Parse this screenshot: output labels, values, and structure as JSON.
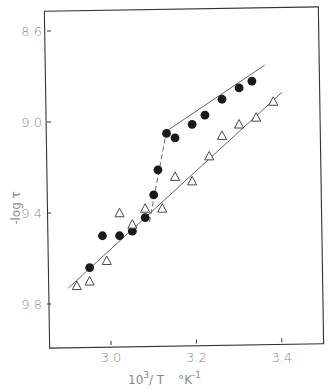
{
  "chart_data": {
    "type": "scatter",
    "title": "",
    "xlabel": "10^3/T  °K^-1",
    "xlabel_parts": {
      "base": "10",
      "sup": "3",
      "rest": "/ T",
      "unit": "°K",
      "unit_sup": "-1"
    },
    "ylabel": "-log τ",
    "xlim": [
      2.85,
      3.5
    ],
    "ylim": [
      10.0,
      8.5
    ],
    "y_inverted": true,
    "grid": false,
    "legend": null,
    "x_ticks": [
      3.0,
      3.2,
      3.4
    ],
    "x_tick_labels": [
      "3.0",
      "3.2",
      "3.4"
    ],
    "y_ticks": [
      8.6,
      9.0,
      9.4,
      9.8
    ],
    "y_tick_labels": [
      "8.6",
      "9.0",
      "9.4",
      "9.8"
    ],
    "series": [
      {
        "name": "filled circles",
        "marker": "filled-circle",
        "color": "#1a1a1a",
        "x": [
          2.95,
          2.98,
          3.02,
          3.05,
          3.08,
          3.1,
          3.11,
          3.13,
          3.15,
          3.19,
          3.22,
          3.26,
          3.3,
          3.33
        ],
        "y": [
          9.64,
          9.5,
          9.5,
          9.48,
          9.42,
          9.32,
          9.21,
          9.05,
          9.07,
          9.01,
          8.97,
          8.9,
          8.85,
          8.82
        ]
      },
      {
        "name": "open triangles",
        "marker": "open-triangle",
        "color": "#333333",
        "x": [
          2.92,
          2.95,
          2.99,
          3.02,
          3.05,
          3.08,
          3.12,
          3.15,
          3.19,
          3.23,
          3.26,
          3.3,
          3.34,
          3.38
        ],
        "y": [
          9.72,
          9.7,
          9.61,
          9.4,
          9.45,
          9.38,
          9.38,
          9.24,
          9.26,
          9.15,
          9.06,
          9.01,
          8.98,
          8.91
        ]
      }
    ],
    "fit_lines": [
      {
        "name": "triangle fit",
        "style": "solid",
        "from": [
          2.9,
          9.73
        ],
        "to": [
          3.4,
          8.87
        ]
      },
      {
        "name": "circle fit low-T",
        "style": "solid",
        "from": [
          3.13,
          9.04
        ],
        "to": [
          3.36,
          8.75
        ]
      },
      {
        "name": "circle transition",
        "style": "dashed",
        "from": [
          3.09,
          9.44
        ],
        "to": [
          3.13,
          9.04
        ]
      }
    ]
  }
}
